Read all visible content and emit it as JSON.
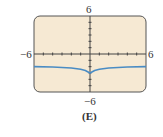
{
  "chart_data": {
    "type": "line",
    "title": "",
    "panel_label": "(E)",
    "xlabel": "",
    "ylabel": "",
    "xlim": [
      -6,
      6
    ],
    "ylim": [
      -6,
      6
    ],
    "tick_labels": {
      "x_min": "−6",
      "x_max": "6",
      "y_min": "−6",
      "y_max": "6"
    },
    "grid": false,
    "series": [
      {
        "name": "curve",
        "color": "#4a8cc4",
        "x": [
          -6,
          -4,
          -2,
          -1,
          -0.5,
          0,
          0.5,
          1,
          2,
          4,
          6
        ],
        "y": [
          -2.0,
          -2.05,
          -2.2,
          -2.4,
          -2.6,
          -3.0,
          -2.6,
          -2.4,
          -2.2,
          -2.05,
          -2.0
        ]
      }
    ],
    "background_color": "#f6e9d3",
    "border_color": "#555555"
  }
}
